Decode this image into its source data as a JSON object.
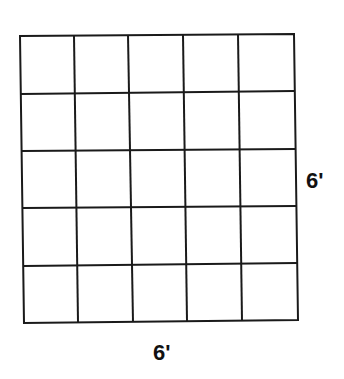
{
  "diagram": {
    "type": "square-grid",
    "rows": 5,
    "columns": 5,
    "line_color": "#1a1a1a",
    "background": "#ffffff",
    "width_label": "6'",
    "height_label": "6'"
  }
}
